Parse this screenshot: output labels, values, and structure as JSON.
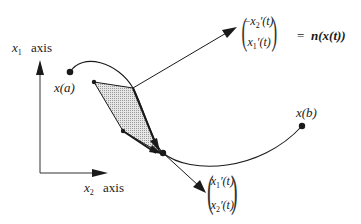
{
  "axes": {
    "x1_label": {
      "var": "x",
      "sub": "1",
      "word": "axis"
    },
    "x2_label": {
      "var": "x",
      "sub": "2",
      "word": "axis"
    }
  },
  "curve": {
    "start_label": "x(a)",
    "end_label": "x(b)"
  },
  "normal_vector": {
    "top": {
      "sign": "−",
      "var": "x",
      "sub": "2",
      "deriv": "′(t)"
    },
    "bottom": {
      "sign": "",
      "var": "x",
      "sub": "1",
      "deriv": "′(t)"
    },
    "equals": "=",
    "name": "n(x(t))"
  },
  "tangent_vector": {
    "top": {
      "var": "x",
      "sub": "1",
      "deriv": "′(t)"
    },
    "bottom": {
      "var": "x",
      "sub": "2",
      "deriv": "′(t)"
    }
  },
  "colors": {
    "stroke": "#1a1a1a",
    "shade": "#d4d4d4"
  }
}
